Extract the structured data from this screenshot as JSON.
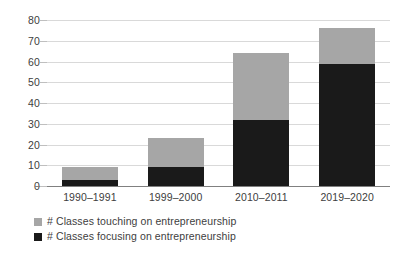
{
  "chart_data": {
    "type": "bar",
    "subtype": "stacked-vertical",
    "title": "",
    "xlabel": "",
    "ylabel": "",
    "ylim": [
      0,
      80
    ],
    "yticks": [
      0,
      10,
      20,
      30,
      40,
      50,
      60,
      70,
      80
    ],
    "grid": true,
    "legend_position": "bottom-left",
    "categories": [
      "1990–1991",
      "1999–2000",
      "2010–2011",
      "2019–2020"
    ],
    "series": [
      {
        "name": "# Classes focusing on entrepreneurship",
        "color": "#1a1a1a",
        "values": [
          3,
          9,
          32,
          59
        ]
      },
      {
        "name": "# Classes touching on entrepreneurship",
        "color": "#a6a6a6",
        "values": [
          6,
          14,
          32,
          17
        ]
      }
    ],
    "stack_totals": [
      9,
      23,
      64,
      76
    ]
  },
  "legend": {
    "items": [
      {
        "label": "# Classes touching on entrepreneurship",
        "color": "#a6a6a6"
      },
      {
        "label": "# Classes focusing on entrepreneurship",
        "color": "#1a1a1a"
      }
    ]
  },
  "colors": {
    "gridline": "#d9d9d9",
    "axis": "#808080",
    "text": "#404040",
    "background": "#ffffff"
  }
}
